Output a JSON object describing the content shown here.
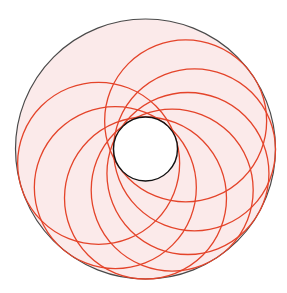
{
  "diagram": {
    "type": "annulus-with-tangent-circles",
    "canvas": {
      "width": 287,
      "height": 293
    },
    "center": {
      "x": 145.5,
      "y": 149
    },
    "outer_circle": {
      "r": 130,
      "fill": "#fbeaea",
      "stroke": "#4a4a4a",
      "stroke_width": 1.2
    },
    "inner_circle": {
      "r": 32,
      "fill": "#ffffff",
      "stroke": "#111111",
      "stroke_width": 1.4
    },
    "chain_circles": {
      "r": 81,
      "center_distance": 49,
      "stroke": "#e4442a",
      "stroke_width": 1.3,
      "angles_deg": [
        -35,
        1,
        30,
        57,
        90,
        128,
        163
      ]
    }
  }
}
